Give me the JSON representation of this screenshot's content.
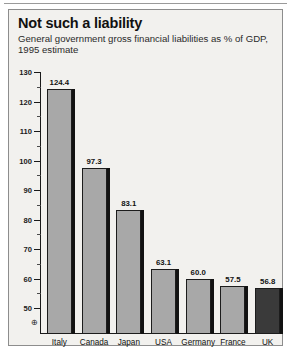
{
  "figure": {
    "title": "Not such a liability",
    "subtitle": "General government gross financial liabilities as % of GDP, 1995 estimate",
    "axis_break_symbol": "⊕",
    "colors": {
      "background": "#f2f1ee",
      "bar_fill": "#a8a8a8",
      "bar_highlight_fill": "#3a3a3a",
      "bar_outline": "#1c1c1c",
      "shadow": "#121212",
      "text": "#111111"
    }
  },
  "chart_data": {
    "type": "bar",
    "title": "Not such a liability",
    "subtitle": "General government gross financial liabilities as % of GDP, 1995 estimate",
    "xlabel": "",
    "ylabel": "",
    "ylim": [
      50,
      130
    ],
    "axis_break_at_zero": true,
    "grid": false,
    "legend": null,
    "ytick_labels": [
      "130",
      "120",
      "110",
      "100",
      "90",
      "80",
      "70",
      "60",
      "50"
    ],
    "ytick_values": [
      130,
      120,
      110,
      100,
      90,
      80,
      70,
      60,
      50
    ],
    "ytick_minor_values": [
      125,
      115,
      105,
      95,
      85,
      75,
      65,
      55
    ],
    "categories": [
      "Italy",
      "Canada",
      "Japan",
      "USA",
      "Germany",
      "France",
      "UK"
    ],
    "values": [
      124.4,
      97.3,
      83.1,
      63.1,
      60.0,
      57.5,
      56.8
    ],
    "value_labels": [
      "124.4",
      "97.3",
      "83.1",
      "63.1",
      "60.0",
      "57.5",
      "56.8"
    ],
    "highlighted_categories": [
      "UK"
    ]
  }
}
